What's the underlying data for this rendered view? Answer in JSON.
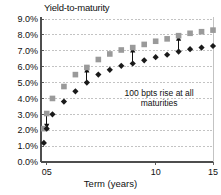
{
  "chart_data": {
    "type": "scatter",
    "title": "Yield-to-maturity",
    "xlabel": "Term (years)",
    "ylabel": "",
    "xlim": [
      0,
      15
    ],
    "ylim": [
      0.0,
      9.0
    ],
    "grid": true,
    "legend": "none",
    "y_tick_labels": [
      "0.0%",
      "1.0%",
      "2.0%",
      "3.0%",
      "4.0%",
      "5.0%",
      "6.0%",
      "7.0%",
      "8.0%",
      "9.0%"
    ],
    "y_tick_values": [
      0.0,
      1.0,
      2.0,
      3.0,
      4.0,
      5.0,
      6.0,
      7.0,
      8.0,
      9.0
    ],
    "x_tick_labels": [
      "05",
      "10",
      "15"
    ],
    "x_tick_values": [
      0.5,
      10,
      15
    ],
    "annotations": [
      {
        "text": "100 bpts rise at all",
        "x": 10.3,
        "y": 4.15
      },
      {
        "text": "maturities",
        "x": 10.3,
        "y": 3.55
      }
    ],
    "annotation_text": "100 bpts rise at all maturities",
    "series": [
      {
        "name": "base-yield-curve",
        "marker": "diamond",
        "color": "#1a1a1a",
        "x": [
          0.25,
          0.5,
          1.0,
          2.0,
          3.0,
          4.0,
          5.0,
          6.0,
          7.0,
          8.0,
          9.0,
          10.0,
          11.0,
          12.0,
          13.0,
          14.0,
          15.0
        ],
        "y": [
          1.2,
          2.1,
          3.0,
          3.8,
          4.45,
          5.0,
          5.5,
          5.8,
          6.05,
          6.2,
          6.4,
          6.6,
          6.75,
          6.95,
          7.1,
          7.2,
          7.3
        ]
      },
      {
        "name": "shifted-yield-curve",
        "marker": "square",
        "color": "#9a9a9a",
        "x": [
          0.25,
          0.5,
          1.0,
          2.0,
          3.0,
          4.0,
          5.0,
          6.0,
          7.0,
          8.0,
          9.0,
          10.0,
          11.0,
          12.0,
          13.0,
          14.0,
          15.0
        ],
        "y": [
          2.1,
          3.05,
          4.0,
          4.75,
          5.5,
          5.95,
          6.45,
          6.8,
          7.05,
          7.2,
          7.4,
          7.6,
          7.75,
          7.95,
          8.1,
          8.2,
          8.3
        ]
      }
    ],
    "shift_arrows": [
      {
        "x": 0.5,
        "y_from": 3.05,
        "y_to": 2.1
      },
      {
        "x": 4.0,
        "y_from": 5.0,
        "y_to": 5.95
      },
      {
        "x": 8.0,
        "y_from": 6.2,
        "y_to": 7.2
      },
      {
        "x": 12.0,
        "y_from": 6.95,
        "y_to": 7.95
      }
    ]
  },
  "colors": {
    "axis": "#4d4d4d",
    "grid": "#b4b4b4",
    "base_series": "#1a1a1a",
    "shifted_series": "#9a9a9a",
    "text": "#111111",
    "background": "#ffffff"
  }
}
